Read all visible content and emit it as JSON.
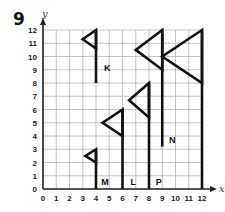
{
  "problem_number": "9",
  "grid": {
    "x_min": 0,
    "x_max": 12,
    "y_min": 0,
    "y_max": 12,
    "x_axis_label": "x",
    "y_axis_label": "y",
    "x_ticks": [
      "0",
      "1",
      "2",
      "3",
      "4",
      "5",
      "6",
      "7",
      "8",
      "9",
      "10",
      "11",
      "12"
    ],
    "y_ticks": [
      "0",
      "1",
      "2",
      "3",
      "4",
      "5",
      "6",
      "7",
      "8",
      "9",
      "10",
      "11",
      "12"
    ],
    "grid_color": "#b5b5b5",
    "line_color": "#111111"
  },
  "flags": [
    {
      "label": "K",
      "pole": [
        [
          4,
          8
        ],
        [
          4,
          12
        ]
      ],
      "triangle": [
        [
          4,
          12
        ],
        [
          3,
          11.3
        ],
        [
          4,
          10.6
        ]
      ],
      "label_pos": [
        4.6,
        8.9
      ]
    },
    {
      "label": "M",
      "pole": [
        [
          4,
          0
        ],
        [
          4,
          3
        ]
      ],
      "triangle": [
        [
          4,
          3
        ],
        [
          3.2,
          2.5
        ],
        [
          4,
          2
        ]
      ],
      "label_pos": [
        4.4,
        0.3
      ]
    },
    {
      "label": "",
      "pole": [
        [
          6,
          0
        ],
        [
          6,
          6
        ]
      ],
      "triangle": [
        [
          6,
          6
        ],
        [
          4.5,
          5
        ],
        [
          6,
          4
        ]
      ],
      "label_pos": null
    },
    {
      "label": "L",
      "pole": [
        [
          8,
          0
        ],
        [
          8,
          8
        ]
      ],
      "triangle": [
        [
          8,
          8
        ],
        [
          6.5,
          6.7
        ],
        [
          8,
          5.4
        ]
      ],
      "label_pos": [
        6.6,
        0.3
      ]
    },
    {
      "label": "P",
      "pole": [
        [
          9,
          3.2
        ],
        [
          9,
          12
        ]
      ],
      "triangle": [
        [
          9,
          12
        ],
        [
          7,
          10.5
        ],
        [
          9,
          9
        ]
      ],
      "label_pos": [
        8.5,
        0.3
      ]
    },
    {
      "label": "N",
      "pole": [
        [
          12,
          0
        ],
        [
          12,
          12
        ]
      ],
      "triangle": [
        [
          12,
          12
        ],
        [
          9,
          10
        ],
        [
          12,
          8
        ]
      ],
      "label_pos": [
        9.5,
        3.5
      ]
    }
  ]
}
